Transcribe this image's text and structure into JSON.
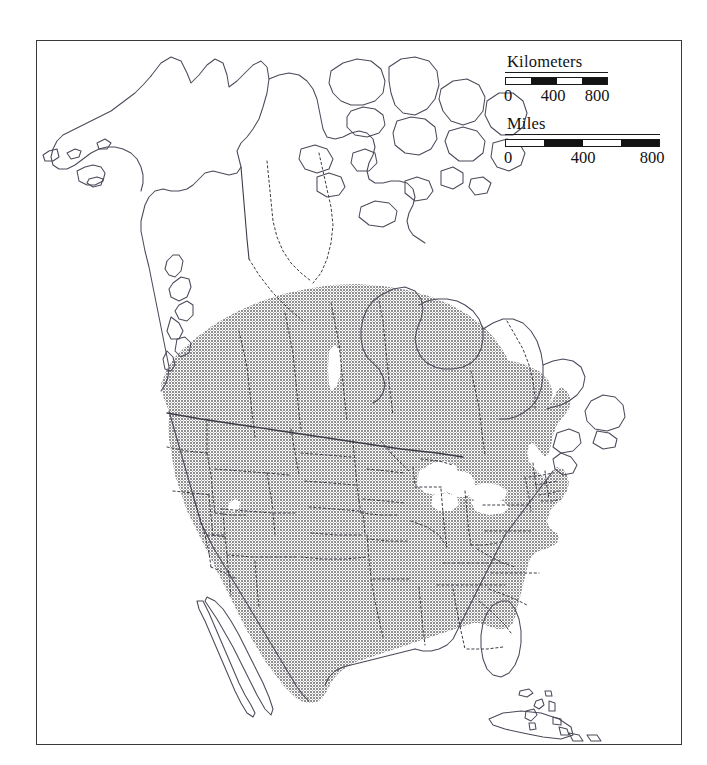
{
  "figure": {
    "kind": "species-distribution-map",
    "region": "North America",
    "frame": {
      "x": 36,
      "y": 40,
      "width": 646,
      "height": 705
    },
    "background_color": "#ffffff",
    "frame_color": "#3a3a3a"
  },
  "legend_scales": [
    {
      "id": "kilometers",
      "title": "Kilometers",
      "unit": "Kilometers",
      "tick_labels": [
        "0",
        "400",
        "800"
      ],
      "tick_values": [
        0,
        400,
        800
      ],
      "bar_length_px": 103,
      "segments": [
        "white",
        "black",
        "white",
        "black"
      ],
      "segment_count": 4,
      "segment_value": 200
    },
    {
      "id": "miles",
      "title": "Miles",
      "unit": "Miles",
      "tick_labels": [
        "0",
        "400",
        "800"
      ],
      "tick_values": [
        0,
        400,
        800
      ],
      "bar_length_px": 155,
      "segments": [
        "white",
        "black",
        "white",
        "black"
      ],
      "segment_count": 4,
      "segment_value": 200
    }
  ],
  "map_layers": {
    "coastline_color": "#4a4a5a",
    "political_border_color": "#3c3c48",
    "state_border_style": "dotted",
    "range_shading_color": "#9a9a9a",
    "range_shading_pattern": "halftone-stipple",
    "water_color": "#ffffff",
    "land_color": "#ffffff"
  },
  "range_description": {
    "covers": "Contiguous United States, southern Canada, northern Mexico",
    "excludes": "Alaska, northern Canada, Hudson Bay, Greenland, Caribbean, Baja California peninsula tip"
  },
  "labelled_features": {
    "alaska": "Alaska",
    "hudson_bay": "Hudson Bay",
    "great_lakes": "Great Lakes",
    "baja_california": "Baja California",
    "great_salt_lake": "Great Salt Lake",
    "lake_winnipeg": "Lake Winnipeg"
  }
}
